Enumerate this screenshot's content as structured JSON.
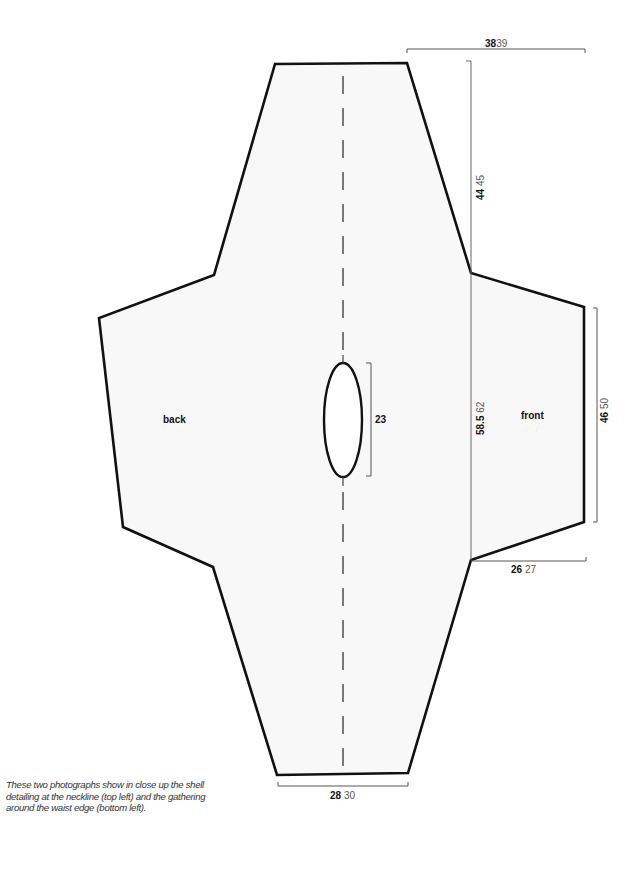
{
  "diagram": {
    "pieces": [
      {
        "name": "back",
        "label": "back"
      },
      {
        "name": "front",
        "label": "front"
      }
    ],
    "measurements": {
      "top_width": {
        "primary": "38",
        "alt": "39"
      },
      "shoulder_drop": {
        "primary": "44",
        "alt": "45"
      },
      "neck_opening": {
        "primary": "23",
        "alt": ""
      },
      "body_length": {
        "primary": "58.5",
        "alt": "62"
      },
      "side_height": {
        "primary": "46",
        "alt": "50"
      },
      "sleeve_width": {
        "primary": "26",
        "alt": "27"
      },
      "bottom_width": {
        "primary": "28",
        "alt": "30"
      }
    },
    "colors": {
      "outline": "#111111",
      "fill": "#f8f8f8",
      "dimension_line": "#555555"
    }
  },
  "caption": {
    "text": "These two photographs show in close up the shell detailing at the neckline (top left) and the gathering around the waist edge (bottom left)."
  }
}
